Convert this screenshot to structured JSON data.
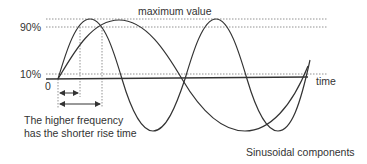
{
  "diagram": {
    "title": "Sinusoidal components",
    "labels": {
      "maximum": "maximum value",
      "level_high": "90%",
      "level_low": "10%",
      "origin": "0",
      "x_axis": "time",
      "caption_line1": "The higher frequency",
      "caption_line2": "has the shorter rise time",
      "figure_caption": "Sinusoidal components"
    },
    "series": [
      {
        "name": "higher-frequency sinusoid",
        "relative_frequency": 2,
        "peak_x": 90
      },
      {
        "name": "lower-frequency sinusoid",
        "relative_frequency": 1,
        "peak_x": 119
      }
    ],
    "reference_lines": [
      "maximum value",
      "90%",
      "10%"
    ],
    "rise_time_markers": [
      {
        "series": "higher-frequency sinusoid",
        "label": "shorter rise time"
      },
      {
        "series": "lower-frequency sinusoid",
        "label": "longer rise time"
      }
    ],
    "colors": {
      "stroke": "#333333",
      "dotted": "#777777",
      "background": "#ffffff"
    }
  }
}
